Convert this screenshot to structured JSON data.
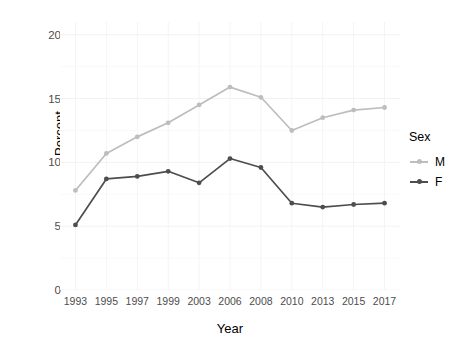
{
  "chart_data": {
    "type": "line",
    "title": "",
    "xlabel": "Year",
    "ylabel": "Percent",
    "categories": [
      "1993",
      "1995",
      "1997",
      "1999",
      "2003",
      "2006",
      "2008",
      "2010",
      "2013",
      "2015",
      "2017"
    ],
    "series": [
      {
        "name": "M",
        "color": "#bdbdbd",
        "values": [
          7.8,
          10.7,
          12.0,
          13.1,
          14.5,
          15.9,
          15.1,
          12.5,
          13.5,
          14.1,
          14.3
        ]
      },
      {
        "name": "F",
        "color": "#4d4d4d",
        "values": [
          5.1,
          8.7,
          8.9,
          9.3,
          8.4,
          10.3,
          9.6,
          6.8,
          6.5,
          6.7,
          6.8
        ]
      }
    ],
    "ylim": [
      0,
      21
    ],
    "yticks": [
      "0",
      "5",
      "10",
      "15",
      "20"
    ],
    "ytick_values": [
      0,
      5,
      10,
      15,
      20
    ],
    "grid": true,
    "legend_position": "right",
    "legend_title": "Sex"
  }
}
